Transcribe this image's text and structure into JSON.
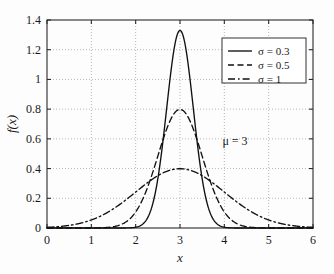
{
  "chart_data": {
    "type": "line",
    "title": "",
    "xlabel": "x",
    "ylabel": "f(x)",
    "xlim": [
      0,
      6
    ],
    "ylim": [
      0,
      1.4
    ],
    "xticks": [
      "0",
      "1",
      "2",
      "3",
      "4",
      "5",
      "6"
    ],
    "xtick_values": [
      0,
      1,
      2,
      3,
      4,
      5,
      6
    ],
    "yticks": [
      "0",
      "0.2",
      "0.4",
      "0.6",
      "0.8",
      "1",
      "1.2",
      "1.4"
    ],
    "ytick_values": [
      0,
      0.2,
      0.4,
      0.6,
      0.8,
      1,
      1.2,
      1.4
    ],
    "grid": true,
    "legend_position": "upper right",
    "annotations": [
      {
        "text": "μ = 3",
        "x": 4.25,
        "y": 0.52
      }
    ],
    "series": [
      {
        "name": "σ = 0.3",
        "style": "solid",
        "mu": 3,
        "sigma": 0.3,
        "peak": 1.3298,
        "x": [
          0,
          0.25,
          0.5,
          0.75,
          1,
          1.25,
          1.5,
          1.75,
          2,
          2.1,
          2.2,
          2.3,
          2.4,
          2.5,
          2.6,
          2.7,
          2.8,
          2.9,
          3,
          3.1,
          3.2,
          3.3,
          3.4,
          3.5,
          3.6,
          3.7,
          3.8,
          3.9,
          4,
          4.25,
          4.5,
          4.75,
          5,
          5.25,
          5.5,
          5.75,
          6
        ],
        "y": [
          0,
          0,
          0,
          0,
          0,
          0,
          0,
          0.0001,
          0.0015,
          0.0051,
          0.0153,
          0.0408,
          0.0977,
          0.2091,
          0.4006,
          0.6869,
          1.0543,
          1.4481,
          1.3298,
          1.2579,
          1.0543,
          0.8019,
          0.5481,
          0.3332,
          0.181,
          0.0878,
          0.0381,
          0.0147,
          0.0051,
          0.0002,
          0,
          0,
          0,
          0,
          0,
          0,
          0
        ]
      },
      {
        "name": "σ = 0.5",
        "style": "dashed",
        "mu": 3,
        "sigma": 0.5,
        "peak": 0.7979,
        "x": [
          0,
          0.25,
          0.5,
          0.75,
          1,
          1.25,
          1.5,
          1.75,
          2,
          2.25,
          2.5,
          2.75,
          3,
          3.25,
          3.5,
          3.75,
          4,
          4.25,
          4.5,
          4.75,
          5,
          5.25,
          5.5,
          5.75,
          6
        ],
        "y": [
          0,
          0,
          0,
          0.0001,
          0.0003,
          0.0013,
          0.0044,
          0.0133,
          0.108,
          0.259,
          0.4839,
          0.7041,
          0.7979,
          0.7041,
          0.4839,
          0.259,
          0.108,
          0.035,
          0.0089,
          0.0018,
          0.0003,
          0,
          0,
          0,
          0
        ]
      },
      {
        "name": "σ = 1",
        "style": "dashdot",
        "mu": 3,
        "sigma": 1,
        "peak": 0.3989,
        "x": [
          0,
          0.25,
          0.5,
          0.75,
          1,
          1.25,
          1.5,
          1.75,
          2,
          2.25,
          2.5,
          2.75,
          3,
          3.25,
          3.5,
          3.75,
          4,
          4.25,
          4.5,
          4.75,
          5,
          5.25,
          5.5,
          5.75,
          6
        ],
        "y": [
          0.0044,
          0.0088,
          0.0175,
          0.0317,
          0.054,
          0.0863,
          0.1295,
          0.1826,
          0.242,
          0.3011,
          0.3521,
          0.3867,
          0.3989,
          0.3867,
          0.3521,
          0.3011,
          0.242,
          0.1826,
          0.1295,
          0.0863,
          0.054,
          0.0317,
          0.0175,
          0.0088,
          0.0044
        ]
      }
    ]
  },
  "legend": {
    "entries": [
      {
        "label": "σ = 0.3"
      },
      {
        "label": "σ = 0.5"
      },
      {
        "label": "σ = 1"
      }
    ]
  },
  "axes": {
    "x_title": "x",
    "y_title": "f(x)"
  },
  "annotation": {
    "mu_label": "μ = 3"
  },
  "colors": {
    "curve": "#111111",
    "grid": "#9a9a9a",
    "frame": "#2a2a2a",
    "background": "#fdfdfd"
  }
}
